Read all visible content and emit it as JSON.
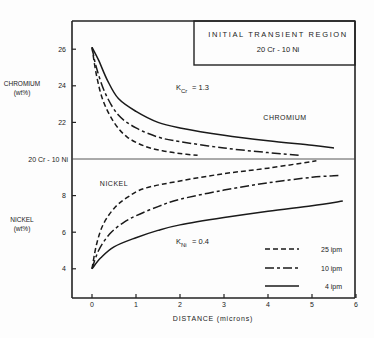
{
  "chart_data": {
    "type": "line",
    "title": "INITIAL TRANSIENT REGION",
    "subtitle": "20 Cr - 10 Ni",
    "xlabel": "DISTANCE (microns)",
    "ylabel_top": "CHROMIUM (wt%)",
    "ylabel_bottom": "NICKEL (wt%)",
    "xlim": [
      -0.4,
      6
    ],
    "xticks": [
      0,
      1,
      2,
      3,
      4,
      5,
      6
    ],
    "chromium_yticks": [
      22,
      24,
      26
    ],
    "nickel_yticks": [
      4,
      6,
      8
    ],
    "baseline_label": "20 Cr - 10 Ni",
    "region_labels": {
      "chromium": "CHROMIUM",
      "nickel": "NICKEL"
    },
    "annotations": {
      "k_cr": "= 1.3",
      "k_cr_sub": "Cr",
      "k_ni": "= 0.4",
      "k_ni_sub": "Ni",
      "k": "K"
    },
    "legend": [
      {
        "name": "25 ipm",
        "style": "dashed"
      },
      {
        "name": "10 ipm",
        "style": "dash-dot"
      },
      {
        "name": "4 ipm",
        "style": "solid"
      }
    ],
    "chromium_series": [
      {
        "name": "25 ipm",
        "x": [
          0,
          0.1,
          0.25,
          0.5,
          0.8,
          1.2,
          1.6,
          2.0,
          2.4
        ],
        "y": [
          26.1,
          24.6,
          23.2,
          22.0,
          21.2,
          20.7,
          20.45,
          20.3,
          20.2
        ]
      },
      {
        "name": "10 ipm",
        "x": [
          0,
          0.1,
          0.3,
          0.6,
          1.0,
          1.5,
          2.0,
          3.0,
          4.0,
          4.7
        ],
        "y": [
          26.1,
          25.0,
          23.6,
          22.4,
          21.7,
          21.2,
          20.95,
          20.6,
          20.35,
          20.2
        ]
      },
      {
        "name": "4 ipm",
        "x": [
          0,
          0.15,
          0.35,
          0.6,
          1.0,
          1.5,
          2.0,
          3.0,
          4.0,
          5.0,
          5.5
        ],
        "y": [
          26.1,
          25.4,
          24.3,
          23.3,
          22.6,
          22.0,
          21.7,
          21.3,
          21.0,
          20.75,
          20.6
        ]
      }
    ],
    "nickel_series": [
      {
        "name": "25 ipm",
        "x": [
          0,
          0.1,
          0.25,
          0.5,
          0.8,
          1.2,
          2.0,
          3.0,
          4.0,
          5.1
        ],
        "y": [
          4.0,
          5.3,
          6.4,
          7.3,
          7.9,
          8.4,
          8.8,
          9.2,
          9.5,
          9.9
        ]
      },
      {
        "name": "10 ipm",
        "x": [
          0,
          0.15,
          0.4,
          0.7,
          1.0,
          1.5,
          2.0,
          3.0,
          4.0,
          5.0,
          5.6
        ],
        "y": [
          4.0,
          5.0,
          5.9,
          6.5,
          6.9,
          7.4,
          7.8,
          8.3,
          8.7,
          9.0,
          9.1
        ]
      },
      {
        "name": "4 ipm",
        "x": [
          0,
          0.2,
          0.5,
          1.0,
          1.5,
          2.0,
          3.0,
          4.0,
          5.0,
          5.7
        ],
        "y": [
          4.0,
          4.6,
          5.2,
          5.7,
          6.1,
          6.4,
          6.8,
          7.15,
          7.45,
          7.7
        ]
      }
    ]
  }
}
